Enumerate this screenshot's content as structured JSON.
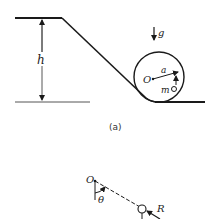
{
  "figure_a": {
    "caption": "(a)",
    "labels": {
      "height": "h",
      "gravity": "g",
      "center": "O",
      "radius": "a",
      "mass": "m"
    }
  },
  "figure_b": {
    "labels": {
      "pivot": "O",
      "angle": "θ",
      "reaction": "R"
    }
  },
  "colors": {
    "line": "#1a1a1a",
    "background": "#ffffff"
  }
}
